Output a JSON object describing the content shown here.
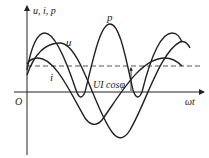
{
  "diagram": {
    "title": "",
    "y_axis_label": "u, i, p",
    "x_axis_label": "ωt",
    "origin_label": "O",
    "curves": [
      {
        "name": "p",
        "label": "p",
        "description": "instantaneous power (double frequency)"
      },
      {
        "name": "u",
        "label": "u",
        "description": "voltage"
      },
      {
        "name": "i",
        "label": "i",
        "description": "current"
      }
    ],
    "average_line_label": "UI cosφ",
    "colors": {
      "stroke": "#222222",
      "dashed": "#555555",
      "background": "#ffffff"
    }
  }
}
